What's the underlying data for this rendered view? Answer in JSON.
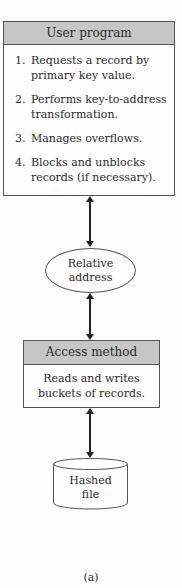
{
  "diagram": {
    "user_program": {
      "title": "User program",
      "items": [
        {
          "num": "1.",
          "text": "Requests a record by primary key value."
        },
        {
          "num": "2.",
          "text": "Performs key-to-address transformation."
        },
        {
          "num": "3.",
          "text": "Manages overflows."
        },
        {
          "num": "4.",
          "text": "Blocks and unblocks records (if necessary)."
        }
      ]
    },
    "relative_address": {
      "line1": "Relative",
      "line2": "address"
    },
    "access_method": {
      "title": "Access method",
      "line1": "Reads and writes",
      "line2": "buckets of records."
    },
    "hashed_file": {
      "line1": "Hashed",
      "line2": "file"
    },
    "caption": "(a)",
    "colors": {
      "header_fill": "#c6c6c6",
      "border": "#555555",
      "arrow": "#222222"
    }
  }
}
